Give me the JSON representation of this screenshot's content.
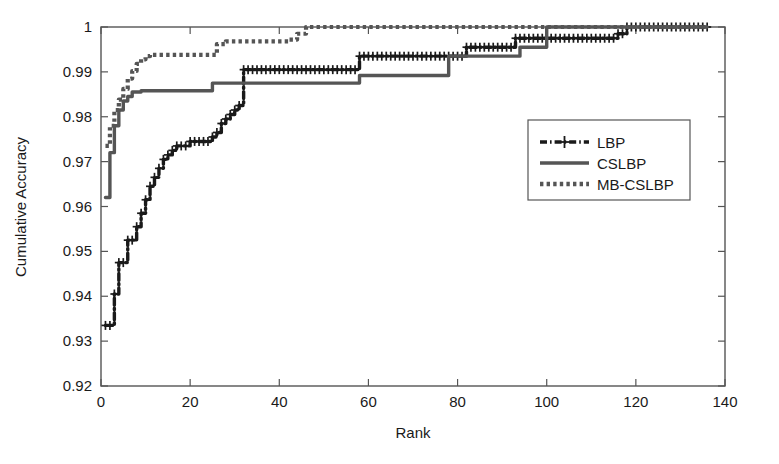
{
  "chart_data": {
    "type": "line",
    "title": "",
    "xlabel": "Rank",
    "ylabel": "Cumulative Accuracy",
    "xlim": [
      0,
      140
    ],
    "ylim": [
      0.92,
      1.0
    ],
    "xticks": [
      0,
      20,
      40,
      60,
      80,
      100,
      120,
      140
    ],
    "xtick_labels": [
      "0",
      "20",
      "40",
      "60",
      "80",
      "100",
      "120",
      "140"
    ],
    "yticks": [
      0.92,
      0.93,
      0.94,
      0.95,
      0.96,
      0.97,
      0.98,
      0.99,
      1.0
    ],
    "ytick_labels": [
      "0.92",
      "0.93",
      "0.94",
      "0.95",
      "0.96",
      "0.97",
      "0.98",
      "0.99",
      "1"
    ],
    "grid": false,
    "legend_position": "center-right",
    "series": [
      {
        "name": "LBP",
        "style": "dashdot",
        "marker": "plus",
        "color": "#1a1a1a",
        "x": [
          1,
          2,
          3,
          4,
          5,
          6,
          7,
          8,
          9,
          10,
          11,
          12,
          13,
          14,
          15,
          16,
          17,
          18,
          19,
          20,
          21,
          22,
          23,
          24,
          25,
          26,
          27,
          28,
          29,
          30,
          31,
          32,
          33,
          34,
          36,
          38,
          40,
          42,
          44,
          46,
          48,
          50,
          52,
          54,
          56,
          57,
          58,
          60,
          62,
          64,
          66,
          68,
          70,
          72,
          74,
          76,
          78,
          80,
          81,
          82,
          84,
          86,
          88,
          90,
          92,
          93,
          94,
          96,
          98,
          100,
          102,
          104,
          106,
          108,
          110,
          112,
          114,
          116,
          118,
          120,
          124,
          128,
          132,
          136
        ],
        "y": [
          0.9335,
          0.9335,
          0.9405,
          0.9475,
          0.9475,
          0.9525,
          0.9525,
          0.9555,
          0.9585,
          0.9615,
          0.9645,
          0.9665,
          0.9685,
          0.9705,
          0.9715,
          0.9725,
          0.9735,
          0.9735,
          0.9735,
          0.9745,
          0.9745,
          0.9745,
          0.9745,
          0.9745,
          0.9755,
          0.9765,
          0.9785,
          0.9795,
          0.9805,
          0.9815,
          0.9825,
          0.9905,
          0.9905,
          0.9905,
          0.9905,
          0.9905,
          0.9905,
          0.9905,
          0.9905,
          0.9905,
          0.9905,
          0.9905,
          0.9905,
          0.9905,
          0.9905,
          0.9905,
          0.9935,
          0.9935,
          0.9935,
          0.9935,
          0.9935,
          0.9935,
          0.9935,
          0.9935,
          0.9935,
          0.9935,
          0.9935,
          0.9935,
          0.9935,
          0.9955,
          0.9955,
          0.9955,
          0.9955,
          0.9955,
          0.9955,
          0.9975,
          0.9975,
          0.9975,
          0.9975,
          0.9975,
          0.9975,
          0.9975,
          0.9975,
          0.9975,
          0.9975,
          0.9975,
          0.9975,
          0.9985,
          1.0,
          1.0,
          1.0,
          1.0,
          1.0,
          1.0
        ],
        "start_value": 0.9335,
        "end_value": 1.0,
        "reaches_one_at_rank": 118
      },
      {
        "name": "CSLBP",
        "style": "solid",
        "marker": "none",
        "color": "#555555",
        "x": [
          1,
          2,
          3,
          4,
          5,
          6,
          7,
          8,
          9,
          10,
          12,
          14,
          16,
          18,
          20,
          22,
          24,
          25,
          26,
          28,
          30,
          32,
          34,
          36,
          38,
          40,
          42,
          44,
          46,
          48,
          50,
          52,
          54,
          56,
          58,
          60,
          62,
          64,
          66,
          68,
          70,
          72,
          74,
          76,
          78,
          80,
          82,
          84,
          86,
          88,
          90,
          92,
          94,
          96,
          98,
          100,
          104,
          108,
          112,
          116,
          120,
          124,
          128,
          132,
          136
        ],
        "y": [
          0.962,
          0.972,
          0.978,
          0.9815,
          0.9835,
          0.9845,
          0.9855,
          0.9855,
          0.9858,
          0.9858,
          0.9858,
          0.9858,
          0.9858,
          0.9858,
          0.9858,
          0.9858,
          0.9858,
          0.9875,
          0.9875,
          0.9875,
          0.9875,
          0.9875,
          0.9875,
          0.9875,
          0.9875,
          0.9875,
          0.9875,
          0.9875,
          0.9875,
          0.9875,
          0.9875,
          0.9875,
          0.9875,
          0.9875,
          0.9892,
          0.9892,
          0.9892,
          0.9892,
          0.9892,
          0.9892,
          0.9892,
          0.9892,
          0.9892,
          0.9892,
          0.9935,
          0.9935,
          0.9935,
          0.9935,
          0.9935,
          0.9935,
          0.9935,
          0.9935,
          0.9955,
          0.9955,
          0.9955,
          1.0,
          1.0,
          1.0,
          1.0,
          1.0,
          1.0,
          1.0,
          1.0,
          1.0,
          1.0
        ],
        "start_value": 0.962,
        "end_value": 1.0,
        "reaches_one_at_rank": 100
      },
      {
        "name": "MB-CSLBP",
        "style": "dotted",
        "marker": "none",
        "color": "#555555",
        "x": [
          1,
          2,
          3,
          4,
          5,
          6,
          7,
          8,
          9,
          10,
          11,
          12,
          13,
          14,
          16,
          18,
          20,
          22,
          24,
          26,
          28,
          30,
          32,
          34,
          36,
          38,
          40,
          42,
          44,
          46,
          48,
          50,
          54,
          58,
          62,
          66,
          70,
          74,
          78,
          82,
          86,
          90,
          94,
          98,
          102,
          106,
          110,
          114,
          118,
          122,
          126,
          130,
          136
        ],
        "y": [
          0.9735,
          0.978,
          0.9815,
          0.9838,
          0.9862,
          0.9885,
          0.9902,
          0.9918,
          0.9928,
          0.9935,
          0.9938,
          0.9938,
          0.9938,
          0.9938,
          0.9938,
          0.9938,
          0.9938,
          0.9938,
          0.9938,
          0.9962,
          0.9968,
          0.9968,
          0.9968,
          0.9968,
          0.9968,
          0.9968,
          0.9968,
          0.9972,
          0.9985,
          1.0,
          1.0,
          1.0,
          1.0,
          1.0,
          1.0,
          1.0,
          1.0,
          1.0,
          1.0,
          1.0,
          1.0,
          1.0,
          1.0,
          1.0,
          1.0,
          1.0,
          1.0,
          1.0,
          1.0,
          1.0,
          1.0,
          1.0,
          1.0
        ],
        "start_value": 0.9735,
        "end_value": 1.0,
        "reaches_one_at_rank": 46
      }
    ]
  },
  "axes": {
    "xlabel": "Rank",
    "ylabel": "Cumulative Accuracy",
    "xtick_labels": [
      "0",
      "20",
      "40",
      "60",
      "80",
      "100",
      "120",
      "140"
    ],
    "ytick_labels": [
      "0.92",
      "0.93",
      "0.94",
      "0.95",
      "0.96",
      "0.97",
      "0.98",
      "0.99",
      "1"
    ]
  },
  "legend": {
    "entries": [
      {
        "label": "LBP",
        "style": "dashdot-plus"
      },
      {
        "label": "CSLBP",
        "style": "solid"
      },
      {
        "label": "MB-CSLBP",
        "style": "dotted"
      }
    ]
  },
  "colors": {
    "background": "#ffffff",
    "axis": "#555555",
    "lbp": "#1a1a1a",
    "cslbp": "#555555",
    "mbcslbp": "#555555"
  }
}
